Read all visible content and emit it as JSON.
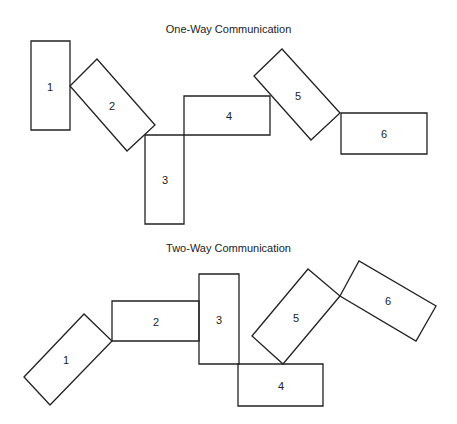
{
  "diagrams": [
    {
      "title": "One-Way Communication",
      "title_y": 23,
      "shapes": [
        {
          "label": "1",
          "points": "31,41 70,41 70,130 31,130",
          "cx": 50,
          "cy": 87
        },
        {
          "label": "2",
          "points": "70,86 97,59 155,125 127,151",
          "cx": 112,
          "cy": 106
        },
        {
          "label": "3",
          "points": "145,135 184,135 184,224 145,224",
          "cx": 165,
          "cy": 180
        },
        {
          "label": "4",
          "points": "184,96 270,96 270,135 184,135",
          "cx": 229,
          "cy": 116
        },
        {
          "label": "5",
          "points": "254,76 282,49 340,113 311,140",
          "cx": 298,
          "cy": 96
        },
        {
          "label": "6",
          "points": "341,113 427,113 427,154 341,154",
          "cx": 384,
          "cy": 134
        }
      ]
    },
    {
      "title": "Two-Way Communication",
      "title_y": 242,
      "shapes": [
        {
          "label": "1",
          "points": "24,377 84,314 112,341 50,405",
          "cx": 66,
          "cy": 360
        },
        {
          "label": "2",
          "points": "112,301 199,301 199,341 112,341",
          "cx": 156,
          "cy": 322
        },
        {
          "label": "3",
          "points": "199,274 239,274 239,364 199,364",
          "cx": 219,
          "cy": 320
        },
        {
          "label": "4",
          "points": "238,364 323,364 323,406 238,406",
          "cx": 281,
          "cy": 386
        },
        {
          "label": "5",
          "points": "252,336 308,269 340,296 283,364",
          "cx": 296,
          "cy": 318
        },
        {
          "label": "6",
          "points": "340,296 359,261 436,306 416,341",
          "cx": 388,
          "cy": 301
        }
      ]
    }
  ],
  "colors": {
    "stroke": "#222222",
    "text": "#222222",
    "background": "#ffffff"
  }
}
